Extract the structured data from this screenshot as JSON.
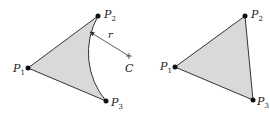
{
  "figures": [
    {
      "name": "circular-arc-triangle",
      "points": [
        {
          "label": "P",
          "sub": "1"
        },
        {
          "label": "P",
          "sub": "2"
        },
        {
          "label": "P",
          "sub": "3"
        }
      ],
      "center_label": "C",
      "radius_label": "r"
    },
    {
      "name": "straight-triangle",
      "points": [
        {
          "label": "P",
          "sub": "1"
        },
        {
          "label": "P",
          "sub": "2"
        },
        {
          "label": "P",
          "sub": "3"
        }
      ]
    }
  ],
  "colors": {
    "fill": "#d9d9d9",
    "stroke": "#333333",
    "point": "#111111"
  }
}
